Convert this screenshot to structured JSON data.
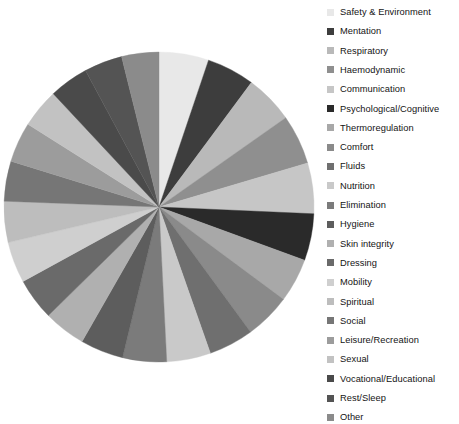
{
  "chart_data": {
    "type": "pie",
    "title": "",
    "subtitle": "",
    "xlabel": "",
    "ylabel": "",
    "grid": false,
    "legend_position": "right",
    "start_angle_deg": 0,
    "direction": "clockwise",
    "center": {
      "x": 159,
      "y": 207
    },
    "radius": 155,
    "categories": [
      "Safety & Environment",
      "Mentation",
      "Respiratory",
      "Haemodynamic",
      "Communication",
      "Psychological/Cognitive",
      "Thermoregulation",
      "Comfort",
      "Fluids",
      "Nutrition",
      "Elimination",
      "Hygiene",
      "Skin integrity",
      "Dressing",
      "Mobility",
      "Spiritual",
      "Social",
      "Leisure/Recreation",
      "Sexual",
      "Vocational/Educational",
      "Rest/Sleep",
      "Other"
    ],
    "values": [
      5.2,
      5.0,
      5.1,
      5.2,
      5.3,
      4.9,
      4.6,
      4.8,
      4.7,
      4.6,
      4.6,
      4.5,
      4.4,
      4.4,
      4.3,
      4.3,
      4.2,
      4.2,
      4.1,
      4.1,
      4.0,
      3.9
    ],
    "colors": [
      "#e8e8e8",
      "#3d3d3d",
      "#b9b9b9",
      "#8f8f8f",
      "#c6c6c6",
      "#2a2a2a",
      "#a8a8a8",
      "#8a8a8a",
      "#6f6f6f",
      "#c9c9c9",
      "#7b7b7b",
      "#5d5d5d",
      "#b0b0b0",
      "#6a6a6a",
      "#cfcfcf",
      "#bdbdbd",
      "#767676",
      "#9c9c9c",
      "#c2c2c2",
      "#4a4a4a",
      "#545454",
      "#8b8b8b"
    ]
  },
  "legend": {
    "items": [
      {
        "label": "Safety & Environment",
        "color": "#e8e8e8"
      },
      {
        "label": "Mentation",
        "color": "#3d3d3d"
      },
      {
        "label": "Respiratory",
        "color": "#b9b9b9"
      },
      {
        "label": "Haemodynamic",
        "color": "#8f8f8f"
      },
      {
        "label": "Communication",
        "color": "#c6c6c6"
      },
      {
        "label": "Psychological/Cognitive",
        "color": "#2a2a2a"
      },
      {
        "label": "Thermoregulation",
        "color": "#a8a8a8"
      },
      {
        "label": "Comfort",
        "color": "#8a8a8a"
      },
      {
        "label": "Fluids",
        "color": "#6f6f6f"
      },
      {
        "label": "Nutrition",
        "color": "#c9c9c9"
      },
      {
        "label": "Elimination",
        "color": "#7b7b7b"
      },
      {
        "label": "Hygiene",
        "color": "#5d5d5d"
      },
      {
        "label": "Skin integrity",
        "color": "#b0b0b0"
      },
      {
        "label": "Dressing",
        "color": "#6a6a6a"
      },
      {
        "label": "Mobility",
        "color": "#cfcfcf"
      },
      {
        "label": "Spiritual",
        "color": "#bdbdbd"
      },
      {
        "label": "Social",
        "color": "#767676"
      },
      {
        "label": "Leisure/Recreation",
        "color": "#9c9c9c"
      },
      {
        "label": "Sexual",
        "color": "#c2c2c2"
      },
      {
        "label": "Vocational/Educational",
        "color": "#4a4a4a"
      },
      {
        "label": "Rest/Sleep",
        "color": "#545454"
      },
      {
        "label": "Other",
        "color": "#8b8b8b"
      }
    ],
    "row_height": 19.3,
    "first_row_top": 2
  }
}
